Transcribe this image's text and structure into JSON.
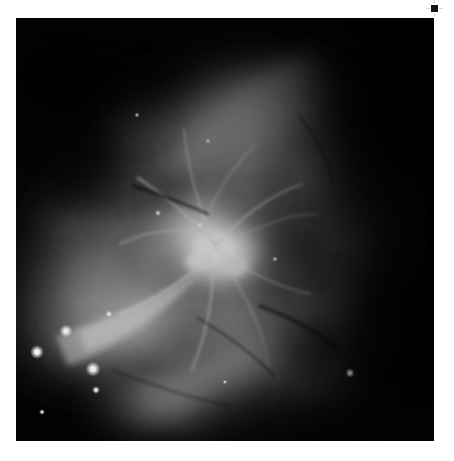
{
  "figure": {
    "title": "",
    "caption": "",
    "background_color": "#ffffff",
    "image_panel": {
      "name": "grayscale-nebula-image",
      "subject": "Orion Nebula (M42) core region",
      "colormap": "grayscale",
      "frame": {
        "x": 16,
        "y": 18,
        "width": 418,
        "height": 423
      },
      "background_color": "#000000",
      "description": "Monochrome astronomical image of an emission nebula. A bright saturated core sits right of center with filamentary wisps radiating outward; a dark dust lane cuts across the upper-left; the right third fades to near black.",
      "brightest_core": {
        "x": 0.47,
        "y": 0.54,
        "peak_level": 255
      },
      "dark_regions": [
        {
          "name": "upper-left-dark-bay",
          "x": 0.08,
          "y": 0.12
        },
        {
          "name": "right-edge-dark",
          "x": 0.9,
          "y": 0.3
        },
        {
          "name": "lower-right-dark-lane",
          "x": 0.68,
          "y": 0.78
        }
      ],
      "stars": [
        {
          "x": 0.12,
          "y": 0.74,
          "radius": 2.6,
          "brightness": 255
        },
        {
          "x": 0.05,
          "y": 0.79,
          "radius": 3.0,
          "brightness": 252
        },
        {
          "x": 0.18,
          "y": 0.83,
          "radius": 3.2,
          "brightness": 255
        },
        {
          "x": 0.19,
          "y": 0.88,
          "radius": 1.6,
          "brightness": 226
        },
        {
          "x": 0.22,
          "y": 0.7,
          "radius": 1.4,
          "brightness": 214
        },
        {
          "x": 0.06,
          "y": 0.93,
          "radius": 1.2,
          "brightness": 198
        },
        {
          "x": 0.8,
          "y": 0.84,
          "radius": 1.8,
          "brightness": 238
        },
        {
          "x": 0.34,
          "y": 0.46,
          "radius": 1.2,
          "brightness": 210
        },
        {
          "x": 0.44,
          "y": 0.49,
          "radius": 1.3,
          "brightness": 222
        },
        {
          "x": 0.29,
          "y": 0.23,
          "radius": 1.0,
          "brightness": 190
        },
        {
          "x": 0.46,
          "y": 0.29,
          "radius": 1.0,
          "brightness": 186
        },
        {
          "x": 0.62,
          "y": 0.57,
          "radius": 1.1,
          "brightness": 196
        },
        {
          "x": 0.5,
          "y": 0.86,
          "radius": 1.0,
          "brightness": 180
        }
      ]
    },
    "corner_marker": {
      "name": "top-right-registration-mark",
      "x": 434,
      "y": 8,
      "color": "#141414"
    }
  }
}
